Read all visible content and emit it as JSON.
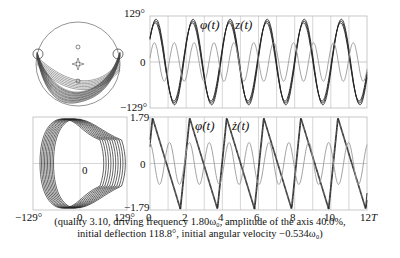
{
  "caption": {
    "line1": "(quality 3.10, driving frequency 1.80ω₀, amplitude of the axis 40.0%,",
    "line2": "initial deflection 118.8°, initial angular velocity −0.534ω₀)"
  },
  "labels": {
    "top_ymax": "129°",
    "top_yzero": "0",
    "top_ymin": "−129°",
    "bot_ymax": "1.79",
    "bot_yzero": "0",
    "bot_ymin": "−1.79",
    "phase_xmin": "−129°",
    "phase_xzero": "0",
    "phase_xmax": "129°",
    "phase_center": "0",
    "phi_t": "φ(t)",
    "z_t": "z(t)",
    "phidot_t": "φ̇(t)",
    "zdot_t": "ż(t)",
    "x_ticks": [
      "0",
      "2",
      "4",
      "6",
      "8",
      "10",
      "12"
    ],
    "x_unit": "T"
  },
  "colors": {
    "main": "#222222",
    "secondary": "#999999",
    "grid": "#bbbbbb"
  },
  "chart_data": [
    {
      "type": "line",
      "title": "Angle and axis position vs time",
      "xlabel": "t (T)",
      "ylabel": "",
      "xlim": [
        0,
        12
      ],
      "ylim": [
        -129,
        129
      ],
      "series": [
        {
          "name": "φ(t)",
          "description": "large oscillation ~period 2T, amplitude ~120°"
        },
        {
          "name": "z(t)",
          "description": "axis displacement, period ~1.1T, amplitude ~40%"
        }
      ],
      "grid": true
    },
    {
      "type": "line",
      "title": "Angular velocity and axis velocity vs time",
      "xlabel": "t (T)",
      "ylabel": "",
      "xlim": [
        0,
        12
      ],
      "ylim": [
        -1.79,
        1.79
      ],
      "series": [
        {
          "name": "φ̇(t)",
          "description": "sawtooth-like, period ~2T, range ±1.79"
        },
        {
          "name": "ż(t)",
          "description": "sinusoid, amplitude ~0.8"
        }
      ],
      "grid": true
    },
    {
      "type": "scatter",
      "title": "Phase portrait",
      "xlim": [
        -129,
        129
      ],
      "ylim": [
        -1.79,
        1.79
      ],
      "xlabel": "φ",
      "ylabel": "φ̇"
    }
  ]
}
